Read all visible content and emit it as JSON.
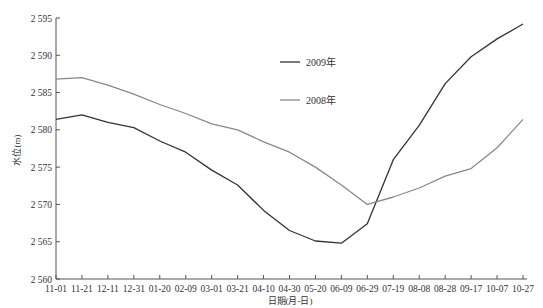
{
  "chart_data": {
    "type": "line",
    "title": "",
    "xlabel": "日期(月-日)",
    "ylabel": "水位(m)",
    "ylim": [
      2560,
      2595
    ],
    "yticks": [
      2560,
      2565,
      2570,
      2575,
      2580,
      2585,
      2590,
      2595
    ],
    "ytick_labels": [
      "2 560",
      "2 565",
      "2 570",
      "2 575",
      "2 580",
      "2 585",
      "2 590",
      "2 595"
    ],
    "grid": false,
    "legend_position": "upper center",
    "categories": [
      "11-01",
      "11-21",
      "12-11",
      "12-31",
      "01-20",
      "02-09",
      "03-01",
      "03-21",
      "04-10",
      "04-30",
      "05-20",
      "06-09",
      "06-29",
      "07-19",
      "08-08",
      "08-28",
      "09-17",
      "10-07",
      "10-27"
    ],
    "series": [
      {
        "name": "2009年",
        "color": "#333333",
        "values": [
          2581.4,
          2582.0,
          2581.0,
          2580.3,
          2578.5,
          2577.0,
          2574.6,
          2572.6,
          2569.2,
          2566.5,
          2565.1,
          2564.8,
          2567.4,
          2576.0,
          2580.6,
          2586.2,
          2589.8,
          2592.2,
          2594.2
        ]
      },
      {
        "name": "2008年",
        "color": "#888888",
        "values": [
          2586.8,
          2587.0,
          2586.0,
          2584.8,
          2583.4,
          2582.2,
          2580.8,
          2580.0,
          2578.4,
          2577.0,
          2575.0,
          2572.6,
          2570.0,
          2571.0,
          2572.2,
          2573.8,
          2574.8,
          2577.6,
          2581.4
        ]
      }
    ]
  },
  "legend": {
    "items": [
      {
        "label": "2009年",
        "color": "#333333"
      },
      {
        "label": "2008年",
        "color": "#888888"
      }
    ]
  },
  "axes": {
    "x_title": "日期(月-日)",
    "y_title": "水位(m)"
  }
}
